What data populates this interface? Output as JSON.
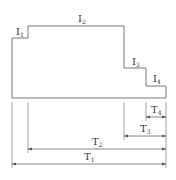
{
  "diagram": {
    "type": "stepped-profile-dimension",
    "colors": {
      "line": "#777777",
      "text": "#333333",
      "background": "#ffffff"
    },
    "profile_labels": [
      {
        "id": "I1",
        "base": "I",
        "sub": "1"
      },
      {
        "id": "I2",
        "base": "I",
        "sub": "2"
      },
      {
        "id": "I3",
        "base": "I",
        "sub": "3"
      },
      {
        "id": "I4",
        "base": "I",
        "sub": "4"
      }
    ],
    "dimension_labels": [
      {
        "id": "T4",
        "base": "T",
        "sub": "4"
      },
      {
        "id": "T3",
        "base": "T",
        "sub": "3"
      },
      {
        "id": "T2",
        "base": "T",
        "sub": "2"
      },
      {
        "id": "T1",
        "base": "T",
        "sub": "1"
      }
    ]
  }
}
